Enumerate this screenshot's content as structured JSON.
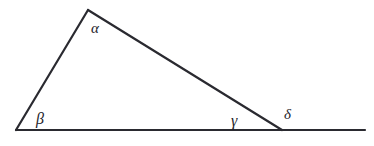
{
  "figure": {
    "background_color": "#ffffff",
    "stroke_color": "#2a2a30",
    "stroke_width": 2.2,
    "text_color": "#23232a",
    "width": 374,
    "height": 146
  },
  "chart_data": {
    "type": "diagram",
    "shape": "triangle-with-extended-base",
    "vertices": {
      "apex": {
        "label": "alpha",
        "x": 88,
        "y": 10
      },
      "bottom_left": {
        "label": "beta",
        "x": 16,
        "y": 130
      },
      "bottom_right": {
        "label": "gamma",
        "x": 282,
        "y": 130
      }
    },
    "segments": [
      {
        "name": "left-side",
        "from": [
          16,
          130
        ],
        "to": [
          88,
          10
        ]
      },
      {
        "name": "hypotenuse",
        "from": [
          88,
          10
        ],
        "to": [
          282,
          130
        ]
      },
      {
        "name": "base",
        "from": [
          16,
          130
        ],
        "to": [
          282,
          130
        ]
      },
      {
        "name": "base-extension",
        "from": [
          282,
          130
        ],
        "to": [
          365,
          130
        ]
      }
    ],
    "angle_labels": [
      {
        "id": "alpha",
        "glyph": "α",
        "x": 91,
        "y": 33,
        "font_size": 15,
        "position": "interior-apex"
      },
      {
        "id": "beta",
        "glyph": "β",
        "x": 36,
        "y": 124,
        "font_size": 16,
        "position": "interior-bottom-left"
      },
      {
        "id": "gamma",
        "glyph": "γ",
        "x": 231,
        "y": 126,
        "font_size": 16,
        "position": "interior-bottom-right"
      },
      {
        "id": "delta",
        "glyph": "δ",
        "x": 284,
        "y": 119,
        "font_size": 15,
        "position": "exterior-bottom-right"
      }
    ]
  }
}
